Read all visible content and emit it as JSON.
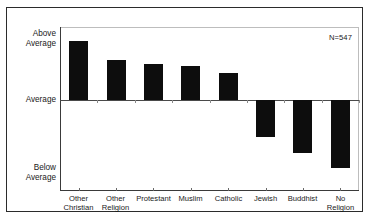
{
  "chart_data": {
    "type": "bar",
    "title": "",
    "subtitle": "",
    "xlabel": "",
    "ylabel": "",
    "categories": [
      "Other\nChristian",
      "Other\nReligion",
      "Protestant",
      "Muslim",
      "Catholic",
      "Jewish",
      "Buddhist",
      "No Religion"
    ],
    "values": [
      0.81,
      0.55,
      0.49,
      0.46,
      0.37,
      -0.41,
      -0.58,
      -0.75
    ],
    "ylim": [
      -1.0,
      1.0
    ],
    "ytick_labels": [
      "Above\nAverage",
      "Average",
      "Below\nAverage"
    ],
    "ytick_values": [
      1.0,
      0.0,
      -1.0
    ],
    "grid": false,
    "legend": false,
    "bar_color": "#0d0d0d",
    "background_color": "#ffffff",
    "annotations": [
      {
        "text": "N=547",
        "position": "top-right"
      }
    ]
  },
  "axis": {
    "y_above_label": "Above\nAverage",
    "y_average_label": "Average",
    "y_below_label": "Below\nAverage"
  },
  "annotation": {
    "sample_size": "N=547"
  }
}
